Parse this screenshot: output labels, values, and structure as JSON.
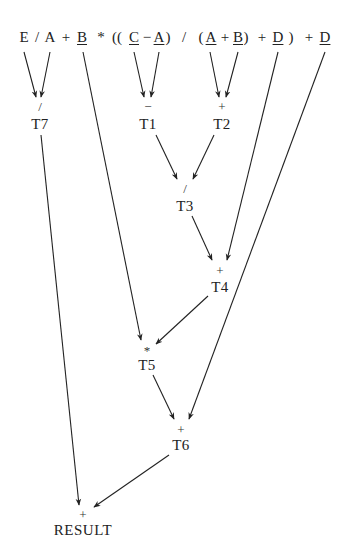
{
  "expression": {
    "tokens": [
      {
        "text": "E",
        "x": 24,
        "underline": false
      },
      {
        "text": "/",
        "x": 37,
        "underline": false
      },
      {
        "text": "A",
        "x": 50,
        "underline": false
      },
      {
        "text": "+",
        "x": 66,
        "underline": false
      },
      {
        "text": "B",
        "x": 82,
        "underline": true
      },
      {
        "text": "*",
        "x": 101,
        "underline": false
      },
      {
        "text": "((",
        "x": 117,
        "underline": false
      },
      {
        "text": "C",
        "x": 134,
        "underline": true
      },
      {
        "text": "−",
        "x": 147,
        "underline": false
      },
      {
        "text": "A",
        "x": 159,
        "underline": true
      },
      {
        "text": ")",
        "x": 168,
        "underline": false
      },
      {
        "text": "/",
        "x": 184,
        "underline": false
      },
      {
        "text": "(",
        "x": 201,
        "underline": false
      },
      {
        "text": "A",
        "x": 211,
        "underline": true
      },
      {
        "text": "+",
        "x": 225,
        "underline": false
      },
      {
        "text": "B",
        "x": 238,
        "underline": true
      },
      {
        "text": ")",
        "x": 246,
        "underline": false
      },
      {
        "text": "+",
        "x": 262,
        "underline": false
      },
      {
        "text": "D",
        "x": 278,
        "underline": true
      },
      {
        "text": ")",
        "x": 291,
        "underline": false
      },
      {
        "text": "+",
        "x": 309,
        "underline": false
      },
      {
        "text": "D",
        "x": 325,
        "underline": true
      }
    ]
  },
  "nodes": [
    {
      "id": "T7",
      "op": "/",
      "label": "T7",
      "x": 40,
      "y_op": 100,
      "y_label": 117
    },
    {
      "id": "T1",
      "op": "−",
      "label": "T1",
      "x": 148,
      "y_op": 100,
      "y_label": 117
    },
    {
      "id": "T2",
      "op": "+",
      "label": "T2",
      "x": 222,
      "y_op": 100,
      "y_label": 117
    },
    {
      "id": "T3",
      "op": "/",
      "label": "T3",
      "x": 185,
      "y_op": 182,
      "y_label": 199
    },
    {
      "id": "T4",
      "op": "+",
      "label": "T4",
      "x": 220,
      "y_op": 264,
      "y_label": 280
    },
    {
      "id": "T5",
      "op": "*",
      "label": "T5",
      "x": 147,
      "y_op": 344,
      "y_label": 358
    },
    {
      "id": "T6",
      "op": "+",
      "label": "T6",
      "x": 181,
      "y_op": 423,
      "y_label": 438
    },
    {
      "id": "RESULT",
      "op": "+",
      "label": "RESULT",
      "x": 83,
      "y_op": 508,
      "y_label": 523
    }
  ],
  "edges": [
    {
      "from": "E",
      "to": "T7",
      "x1": 24,
      "y1": 52,
      "x2": 36,
      "y2": 97
    },
    {
      "from": "A",
      "to": "T7",
      "x1": 50,
      "y1": 52,
      "x2": 41,
      "y2": 97
    },
    {
      "from": "C",
      "to": "T1",
      "x1": 134,
      "y1": 52,
      "x2": 144,
      "y2": 97
    },
    {
      "from": "A",
      "to": "T1",
      "x1": 159,
      "y1": 52,
      "x2": 151,
      "y2": 97
    },
    {
      "from": "A",
      "to": "T2",
      "x1": 210,
      "y1": 52,
      "x2": 219,
      "y2": 97
    },
    {
      "from": "B",
      "to": "T2",
      "x1": 238,
      "y1": 52,
      "x2": 226,
      "y2": 97
    },
    {
      "from": "T1",
      "to": "T3",
      "x1": 156,
      "y1": 135,
      "x2": 177,
      "y2": 179
    },
    {
      "from": "T2",
      "to": "T3",
      "x1": 214,
      "y1": 135,
      "x2": 193,
      "y2": 179
    },
    {
      "from": "T3",
      "to": "T4",
      "x1": 192,
      "y1": 216,
      "x2": 212,
      "y2": 260
    },
    {
      "from": "D",
      "to": "T4",
      "x1": 278,
      "y1": 52,
      "x2": 227,
      "y2": 260
    },
    {
      "from": "B",
      "to": "T5",
      "x1": 83,
      "y1": 52,
      "x2": 141,
      "y2": 340
    },
    {
      "from": "T4",
      "to": "T5",
      "x1": 208,
      "y1": 296,
      "x2": 156,
      "y2": 344
    },
    {
      "from": "T5",
      "to": "T6",
      "x1": 153,
      "y1": 375,
      "x2": 174,
      "y2": 419
    },
    {
      "from": "D",
      "to": "T6",
      "x1": 325,
      "y1": 52,
      "x2": 189,
      "y2": 419
    },
    {
      "from": "T7",
      "to": "RESULT",
      "x1": 41,
      "y1": 135,
      "x2": 79,
      "y2": 505
    },
    {
      "from": "T6",
      "to": "RESULT",
      "x1": 169,
      "y1": 455,
      "x2": 94,
      "y2": 507
    }
  ],
  "colors": {
    "ink": "#222222",
    "background": "#ffffff"
  }
}
